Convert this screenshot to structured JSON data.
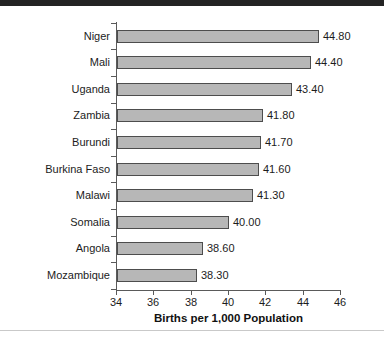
{
  "decor": {
    "top_rule_color": "#232323",
    "bottom_rule_color": "#c9c9c9"
  },
  "chart_data": {
    "type": "bar",
    "orientation": "horizontal",
    "title": "",
    "subtitle": "",
    "xlabel": "Births per 1,000 Population",
    "ylabel": "",
    "categories": [
      "Niger",
      "Mali",
      "Uganda",
      "Zambia",
      "Burundi",
      "Burkina Faso",
      "Malawi",
      "Somalia",
      "Angola",
      "Mozambique"
    ],
    "values": [
      44.8,
      44.4,
      43.4,
      41.8,
      41.7,
      41.6,
      41.3,
      40.0,
      38.6,
      38.3
    ],
    "value_labels": [
      "44.80",
      "44.40",
      "43.40",
      "41.80",
      "41.70",
      "41.60",
      "41.30",
      "40.00",
      "38.60",
      "38.30"
    ],
    "xlim": [
      34,
      46
    ],
    "xticks": [
      34,
      36,
      38,
      40,
      42,
      44,
      46
    ],
    "xtick_labels": [
      "34",
      "36",
      "38",
      "40",
      "42",
      "44",
      "46"
    ],
    "grid": false,
    "legend": null,
    "bar_fill_color": "#b7b7b7",
    "bar_border_color": "#4d4d4d",
    "axis_color": "#5a5a5a",
    "text_color": "#1c1c1c"
  }
}
